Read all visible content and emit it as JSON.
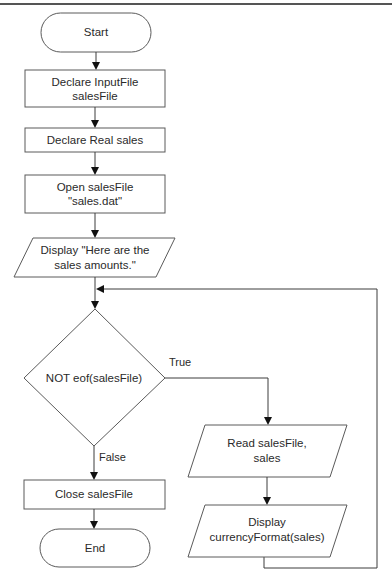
{
  "diagram": {
    "type": "flowchart",
    "colors": {
      "stroke": "#5a5a5a",
      "arrow": "#111111",
      "text": "#2a2a2a",
      "background": "#ffffff"
    },
    "nodes": {
      "start": {
        "shape": "terminal",
        "lines": [
          "Start"
        ]
      },
      "declare_file": {
        "shape": "process",
        "lines": [
          "Declare InputFile",
          "salesFile"
        ]
      },
      "declare_sales": {
        "shape": "process",
        "lines": [
          "Declare Real sales"
        ]
      },
      "open_file": {
        "shape": "process",
        "lines": [
          "Open salesFile",
          "\"sales.dat\""
        ]
      },
      "display_header": {
        "shape": "input-output",
        "lines": [
          "Display \"Here are the",
          "sales amounts.\""
        ]
      },
      "decision": {
        "shape": "decision",
        "lines": [
          "NOT eof(salesFile)"
        ]
      },
      "read_file": {
        "shape": "input-output",
        "lines": [
          "Read salesFile,",
          "sales"
        ]
      },
      "display_sales": {
        "shape": "input-output",
        "lines": [
          "Display",
          "currencyFormat(sales)"
        ]
      },
      "close_file": {
        "shape": "process",
        "lines": [
          "Close salesFile"
        ]
      },
      "end": {
        "shape": "terminal",
        "lines": [
          "End"
        ]
      }
    },
    "branches": {
      "true_label": "True",
      "false_label": "False"
    },
    "edges": [
      [
        "start",
        "declare_file"
      ],
      [
        "declare_file",
        "declare_sales"
      ],
      [
        "declare_sales",
        "open_file"
      ],
      [
        "open_file",
        "display_header"
      ],
      [
        "display_header",
        "decision"
      ],
      [
        "decision",
        "read_file",
        "True"
      ],
      [
        "read_file",
        "display_sales"
      ],
      [
        "display_sales",
        "decision",
        "loop"
      ],
      [
        "decision",
        "close_file",
        "False"
      ],
      [
        "close_file",
        "end"
      ]
    ]
  }
}
